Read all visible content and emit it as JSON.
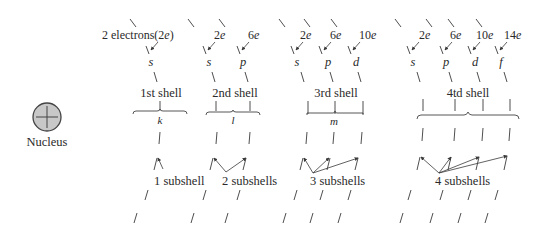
{
  "nucleus": {
    "label": "Nucleus",
    "fill": "#c8c8c8",
    "stroke": "#444444"
  },
  "shells": [
    {
      "id": "shell-1",
      "label": "1st shell",
      "letter": "k",
      "subshell_count_label": "1 subshell",
      "electron_label_prefix": "2 electrons(2",
      "electron_label_suffix": ")",
      "subshells": [
        {
          "name": "s",
          "electrons": "2",
          "unit": "e"
        }
      ]
    },
    {
      "id": "shell-2",
      "label": "2nd shell",
      "letter": "l",
      "subshell_count_label": "2 subshells",
      "subshells": [
        {
          "name": "s",
          "electrons": "2",
          "unit": "e"
        },
        {
          "name": "p",
          "electrons": "6",
          "unit": "e"
        }
      ]
    },
    {
      "id": "shell-3",
      "label": "3rd shell",
      "letter": "m",
      "subshell_count_label": "3 subshells",
      "subshells": [
        {
          "name": "s",
          "electrons": "2",
          "unit": "e"
        },
        {
          "name": "p",
          "electrons": "6",
          "unit": "e"
        },
        {
          "name": "d",
          "electrons": "10",
          "unit": "e"
        }
      ]
    },
    {
      "id": "shell-4",
      "label": "4td shell",
      "letter": "",
      "subshell_count_label": "4 subshells",
      "subshells": [
        {
          "name": "s",
          "electrons": "2",
          "unit": "e"
        },
        {
          "name": "p",
          "electrons": "6",
          "unit": "e"
        },
        {
          "name": "d",
          "electrons": "10",
          "unit": "e"
        },
        {
          "name": "f",
          "electrons": "14",
          "unit": "e"
        }
      ]
    }
  ]
}
